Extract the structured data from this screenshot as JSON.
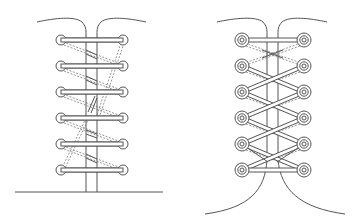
{
  "figure": {
    "width": 357,
    "height": 224,
    "stroke_color": "#555555",
    "lace_fill": "#ffffff",
    "diagrams": [
      {
        "id": "straight-bar-lacing",
        "left_eyelet_x": 61,
        "right_eyelet_x": 123,
        "rows_y": [
          40,
          66,
          92,
          118,
          144,
          170
        ],
        "eyelet_style": "single-ring",
        "vamp_x": [
          86,
          97
        ],
        "bottom": "straight-line"
      },
      {
        "id": "criss-cross-lacing",
        "left_eyelet_x": 242,
        "right_eyelet_x": 304,
        "rows_y": [
          40,
          66,
          92,
          118,
          144,
          170
        ],
        "eyelet_style": "double-ring",
        "vamp_x": [
          267,
          278
        ],
        "bottom": "flared-curves"
      }
    ]
  }
}
